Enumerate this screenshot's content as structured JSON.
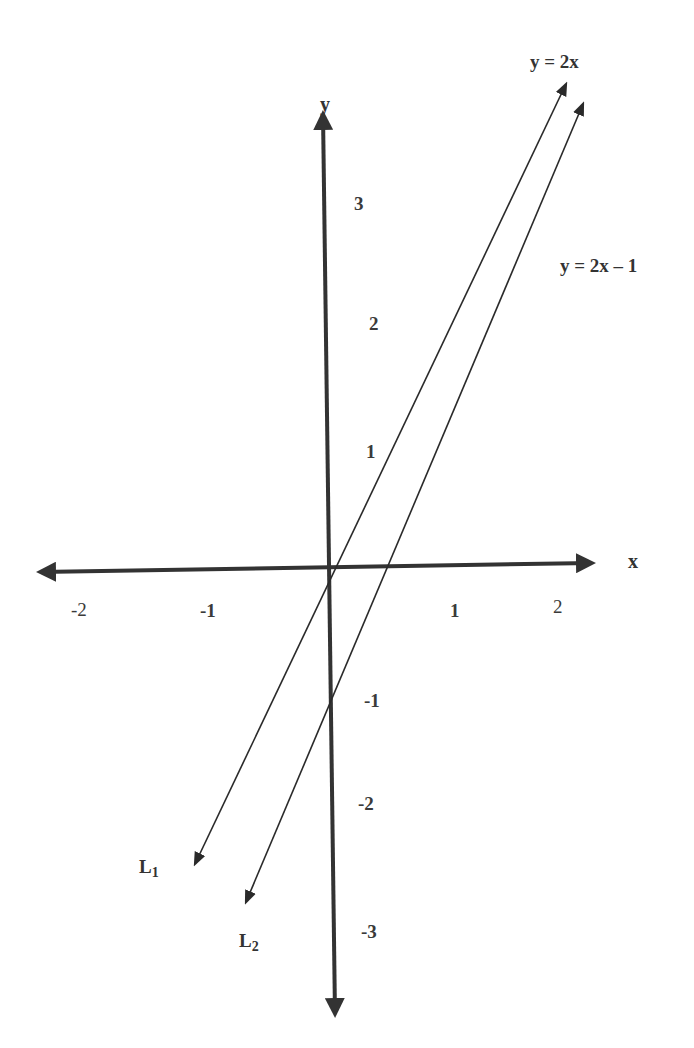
{
  "diagram": {
    "type": "coordinate-plane",
    "axes": {
      "x_label": "x",
      "y_label": "y",
      "x_ticks": [
        "-2",
        "-1",
        "1",
        "2"
      ],
      "y_ticks_positive": [
        "3",
        "2",
        "1"
      ],
      "y_ticks_negative": [
        "-1",
        "-2",
        "-3"
      ]
    },
    "lines": [
      {
        "name": "L",
        "subscript": "1",
        "equation": "y = 2x",
        "slope": 2,
        "intercept": 0
      },
      {
        "name": "L",
        "subscript": "2",
        "equation": "y = 2x – 1",
        "slope": 2,
        "intercept": -1
      }
    ],
    "colors": {
      "axis": "#333333",
      "line": "#2a2a2a",
      "text": "#3a3a3a",
      "background": "#ffffff"
    }
  }
}
